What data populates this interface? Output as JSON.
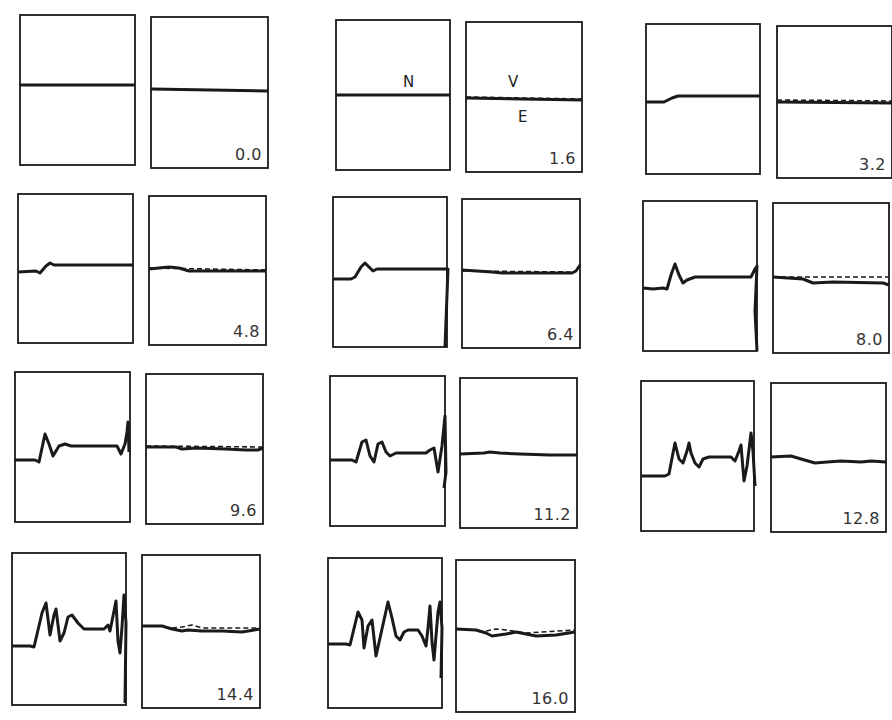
{
  "figure": {
    "annotations": {
      "left_trace_label": "N",
      "right_top_label": "V",
      "right_bottom_label": "E"
    },
    "colors": {
      "stroke": "#1a1a1a",
      "background": "#ffffff",
      "label": "#333333"
    }
  },
  "frames": [
    {
      "label": "0.0",
      "left": {
        "x": 20,
        "y": 15,
        "w": 115,
        "h": 150
      },
      "right": {
        "x": 151,
        "y": 17,
        "w": 117,
        "h": 151
      }
    },
    {
      "label": "1.6",
      "left": {
        "x": 336,
        "y": 20,
        "w": 114,
        "h": 150
      },
      "right": {
        "x": 466,
        "y": 22,
        "w": 116,
        "h": 150
      }
    },
    {
      "label": "3.2",
      "left": {
        "x": 646,
        "y": 24,
        "w": 114,
        "h": 150
      },
      "right": {
        "x": 777,
        "y": 26,
        "w": 115,
        "h": 152
      }
    },
    {
      "label": "4.8",
      "left": {
        "x": 18,
        "y": 194,
        "w": 115,
        "h": 149
      },
      "right": {
        "x": 149,
        "y": 196,
        "w": 117,
        "h": 149
      }
    },
    {
      "label": "6.4",
      "left": {
        "x": 333,
        "y": 197,
        "w": 114,
        "h": 150
      },
      "right": {
        "x": 462,
        "y": 199,
        "w": 118,
        "h": 149
      }
    },
    {
      "label": "8.0",
      "left": {
        "x": 643,
        "y": 201,
        "w": 114,
        "h": 150
      },
      "right": {
        "x": 773,
        "y": 203,
        "w": 116,
        "h": 150
      }
    },
    {
      "label": "9.6",
      "left": {
        "x": 15,
        "y": 372,
        "w": 115,
        "h": 150
      },
      "right": {
        "x": 146,
        "y": 374,
        "w": 117,
        "h": 150
      }
    },
    {
      "label": "11.2",
      "left": {
        "x": 330,
        "y": 376,
        "w": 115,
        "h": 150
      },
      "right": {
        "x": 460,
        "y": 378,
        "w": 117,
        "h": 150
      }
    },
    {
      "label": "12.8",
      "left": {
        "x": 641,
        "y": 381,
        "w": 113,
        "h": 150
      },
      "right": {
        "x": 771,
        "y": 383,
        "w": 115,
        "h": 149
      }
    },
    {
      "label": "14.4",
      "left": {
        "x": 12,
        "y": 553,
        "w": 114,
        "h": 152
      },
      "right": {
        "x": 142,
        "y": 555,
        "w": 118,
        "h": 153
      }
    },
    {
      "label": "16.0",
      "left": {
        "x": 328,
        "y": 558,
        "w": 114,
        "h": 150
      },
      "right": {
        "x": 456,
        "y": 560,
        "w": 119,
        "h": 152
      }
    }
  ],
  "traces": {
    "left": [
      "0,70 115,70",
      "0,75 114,75",
      "0,78 18,78 26,74 32,72 114,72",
      "0,78 18,77 22,79 28,72 32,69 36,71 115,71",
      "0,82 18,82 22,80 28,70 32,66 36,70 40,74 44,72 114,72 115,72 112,150",
      "0,87 10,88 20,87 24,88 28,74 32,63 36,74 40,82 44,79 52,76 108,76 112,68 114,65 112,110 114,150",
      "0,88 20,88 24,90 30,62 34,72 38,84 44,74 50,72 56,74 102,74 106,82 110,72 112,60 113,50 114,80",
      "0,84 22,84 26,86 32,66 36,64 40,80 44,86 48,68 52,66 56,76 60,80 66,77 96,77 100,74 104,72 108,96 112,70 115,40 116,96 114,112",
      "0,95 24,95 28,93 32,72 34,62 38,78 42,82 46,70 48,62 50,72 54,82 58,86 62,78 68,76 90,76 94,80 98,70 100,64 103,100 106,85 110,52 112,70 114,105",
      "0,93 18,93 22,94 30,60 34,50 38,82 42,62 44,56 48,88 52,80 56,64 60,62 66,70 72,76 92,76 96,72 98,78 102,58 104,48 106,88 108,100 110,74 112,42 114,70 113,150",
      "0,86 18,86 22,87 30,54 34,62 36,90 40,68 44,62 48,98 52,80 56,62 60,44 64,60 68,78 72,82 76,74 80,72 90,72 94,78 98,88 100,70 102,48 104,84 106,102 110,54 112,44 114,70 113,120"
    ],
    "right_solid": [
      "0,72 117,74",
      "0,76 116,78",
      "0,76 115,77",
      "0,73 20,71 30,72 40,75 117,75",
      "0,71 30,73 40,74 110,74 114,72 118,66",
      "0,74 30,76 40,80 60,79 110,80 116,82",
      "0,73 30,73 36,75 50,74 80,75 100,76 112,76 117,74",
      "0,76 24,75 30,74 40,75 60,76 90,77 117,77",
      "0,74 20,73 30,76 44,80 56,79 70,78 90,79 100,78 115,79",
      "0,71 20,71 30,74 40,76 46,75 60,76 80,76 100,77 118,74",
      "0,69 20,70 30,73 36,76 50,74 60,72 70,74 80,76 100,75 119,72"
    ],
    "right_dashed": [
      "",
      "0,75 116,77",
      "0,74 115,75",
      "0,72 117,74",
      "0,72 110,73",
      "0,74 116,74",
      "0,72 117,73",
      "",
      "",
      "30,73 40,72 50,70 60,73 118,73",
      "30,71 40,69 50,70 70,73 119,70"
    ]
  }
}
